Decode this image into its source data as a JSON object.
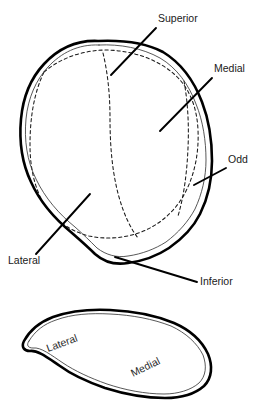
{
  "figure": {
    "background_color": "#ffffff",
    "ink_color": "#000000",
    "width": 263,
    "height": 404,
    "panels": [
      {
        "id": "upper",
        "name": "anterior-patella-outline",
        "description": "Large rounded patella outline with dashed articular facet boundaries"
      },
      {
        "id": "lower",
        "name": "articular-surface-outline",
        "description": "Crescent / kidney shaped articular surface outline"
      }
    ]
  },
  "labels": {
    "superior": {
      "text": "Superior",
      "x": 158,
      "y": 22,
      "panel": "upper"
    },
    "medial_upper": {
      "text": "Medial",
      "x": 214,
      "y": 72,
      "panel": "upper"
    },
    "odd": {
      "text": "Odd",
      "x": 228,
      "y": 163,
      "panel": "upper"
    },
    "lateral_upper": {
      "text": "Lateral",
      "x": 8,
      "y": 264,
      "panel": "upper"
    },
    "inferior": {
      "text": "Inferior",
      "x": 200,
      "y": 285,
      "panel": "upper"
    },
    "lateral_lower": {
      "text": "Lateral",
      "x": 48,
      "y": 352,
      "rotation": -20,
      "panel": "lower"
    },
    "medial_lower": {
      "text": "Medial",
      "x": 133,
      "y": 377,
      "rotation": -26,
      "panel": "lower"
    }
  },
  "leaders": [
    {
      "name": "superior-leader",
      "x1": 156,
      "y1": 28,
      "x2": 111,
      "y2": 75
    },
    {
      "name": "medial-leader",
      "x1": 212,
      "y1": 78,
      "x2": 160,
      "y2": 131
    },
    {
      "name": "odd-leader",
      "x1": 226,
      "y1": 168,
      "x2": 194,
      "y2": 185
    },
    {
      "name": "lateral-leader",
      "x1": 36,
      "y1": 254,
      "x2": 90,
      "y2": 194
    },
    {
      "name": "inferior-leader",
      "x1": 197,
      "y1": 282,
      "x2": 115,
      "y2": 257
    }
  ],
  "geometry": {
    "upper_outline": "M 98 41 C 76 40 58 49 44 64 C 31 78 23 97 21 119 C 19 141 22 163 31 182 C 40 202 55 219 72 233 C 80 240 88 247 95 254 C 104 262 116 265 128 263 C 143 261 157 256 169 248 C 182 239 193 228 200 214 C 208 198 212 180 212 161 C 212 141 209 120 202 102 C 194 81 181 63 163 52 C 144 42 121 40 98 41 Z",
    "upper_outline_inner": "M 99 45 C 78 44 61 53 48 67 C 36 80 28 98 26 119 C 24 140 27 161 36 179 C 45 198 59 214 75 227 C 83 234 90 241 97 248 C 106 255 117 258 128 256 C 142 254 155 249 166 242 C 178 233 188 222 195 209 C 202 194 206 177 206 160 C 206 141 203 121 196 104 C 189 85 177 68 160 58 C 142 48 120 44 99 45 Z",
    "upper_dashed_outer": "M 44 72 C 62 57 84 50 108 50 C 133 51 157 59 174 74 C 190 88 197 108 198 130 C 199 152 195 173 186 191 C 177 209 163 222 146 230 C 128 238 108 240 89 236 C 70 231 54 220 44 204 C 34 187 30 166 30 145 C 30 121 33 95 44 72 Z",
    "upper_dashed_ridge": "M 103 53 C 108 74 110 96 110 118 C 110 145 112 172 119 197 C 124 215 131 229 138 238",
    "upper_dashed_odd": "M 184 81 C 188 103 189 126 188 148 C 187 172 184 196 178 216",
    "lower_outline": "M 24 341 C 30 330 40 322 53 317 C 70 311 90 309 110 310 C 133 311 155 315 174 323 C 190 330 202 341 208 354 C 213 366 212 378 204 386 C 195 394 181 398 165 398 C 145 398 124 394 105 388 C 88 382 72 375 60 366 C 48 358 38 350 30 351 C 24 351 21 347 24 341 Z",
    "lower_outline_inner": "M 29 341 C 35 331 44 324 56 320 C 72 314 91 313 110 314 C 132 315 153 319 171 326 C 186 333 197 343 203 355 C 207 366 206 376 199 383 C 191 390 178 394 164 394 C 145 394 125 390 107 384 C 90 378 75 371 63 363 C 51 355 41 347 33 348 C 28 348 26 345 29 341 Z"
  }
}
